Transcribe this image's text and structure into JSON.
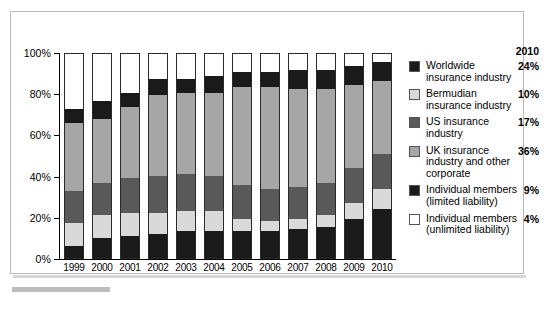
{
  "legend": {
    "header": "2010",
    "items": [
      {
        "label": "Worldwide insurance industry",
        "pct": "24%",
        "color": "#1a1a1a"
      },
      {
        "label": "Bermudian insurance industry",
        "pct": "10%",
        "color": "#d9d9d9"
      },
      {
        "label": "US insurance industry",
        "pct": "17%",
        "color": "#595959"
      },
      {
        "label": "UK insurance industry and other corporate",
        "pct": "36%",
        "color": "#a6a6a6"
      },
      {
        "label": "Individual members (limited liability)",
        "pct": "9%",
        "color": "#1a1a1a"
      },
      {
        "label": "Individual members (unlimited liability)",
        "pct": "4%",
        "color": "#ffffff"
      }
    ]
  },
  "chart_data": {
    "type": "bar",
    "stacked": true,
    "title": "",
    "xlabel": "",
    "ylabel": "",
    "ylim": [
      0,
      100
    ],
    "yticks": [
      0,
      20,
      40,
      60,
      80,
      100
    ],
    "ytick_labels": [
      "0%",
      "20%",
      "40%",
      "60%",
      "80%",
      "100%"
    ],
    "grid": false,
    "legend_position": "right",
    "categories": [
      "1999",
      "2000",
      "2001",
      "2002",
      "2003",
      "2004",
      "2005",
      "2006",
      "2007",
      "2008",
      "2009",
      "2010"
    ],
    "series": [
      {
        "name": "Worldwide insurance industry",
        "color": "#1a1a1a",
        "values": [
          6,
          10,
          11,
          12,
          13,
          13,
          13,
          13,
          14,
          15,
          19,
          24
        ]
      },
      {
        "name": "Bermudian insurance industry",
        "color": "#d9d9d9",
        "values": [
          11,
          11,
          11,
          10,
          10,
          10,
          6,
          5,
          5,
          6,
          8,
          10
        ]
      },
      {
        "name": "US insurance industry",
        "color": "#595959",
        "values": [
          16,
          16,
          17,
          18,
          18,
          17,
          17,
          16,
          16,
          16,
          17,
          17
        ]
      },
      {
        "name": "UK insurance industry and other corporate",
        "color": "#a6a6a6",
        "values": [
          33,
          31,
          35,
          40,
          40,
          41,
          48,
          50,
          48,
          46,
          41,
          36
        ]
      },
      {
        "name": "Individual members (limited liability)",
        "color": "#1a1a1a",
        "values": [
          7,
          9,
          7,
          8,
          7,
          8,
          7,
          7,
          9,
          9,
          9,
          9
        ]
      },
      {
        "name": "Individual members (unlimited liability)",
        "color": "#ffffff",
        "values": [
          27,
          23,
          19,
          12,
          12,
          11,
          9,
          9,
          8,
          8,
          6,
          4
        ]
      }
    ]
  }
}
